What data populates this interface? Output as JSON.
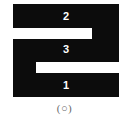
{
  "figure": {
    "caption": "(○)",
    "colors": {
      "shape_fill": "#0c0c0c",
      "background": "#ffffff",
      "label_text": "#ffffff",
      "caption_text": "#6a6a6a"
    },
    "regions": [
      {
        "id": "region-2",
        "label": "2",
        "band": "top"
      },
      {
        "id": "region-3",
        "label": "3",
        "band": "middle"
      },
      {
        "id": "region-1",
        "label": "1",
        "band": "bottom"
      }
    ],
    "slots": [
      {
        "id": "slot-upper",
        "opens": "right"
      },
      {
        "id": "slot-lower",
        "opens": "right"
      }
    ]
  }
}
